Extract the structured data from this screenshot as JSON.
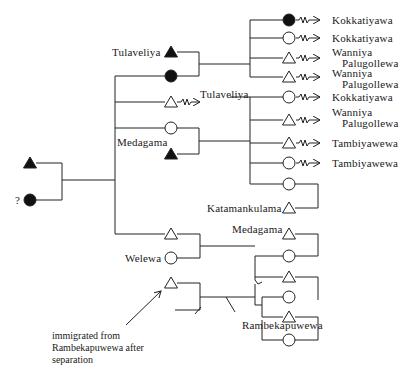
{
  "diagram": {
    "type": "kinship-genealogy",
    "legend_implied": {
      "triangle": "male",
      "circle": "female",
      "filled": "deceased",
      "zigzag-arrow": "moved to village"
    },
    "founders": {
      "male": {
        "symbol": "triangle",
        "filled": true
      },
      "female": {
        "symbol": "circle",
        "filled": true,
        "label": "?"
      }
    },
    "labels": {
      "tulaveliya_top": "Tulaveliya",
      "medagama_mid": "Medagama",
      "tulaveliya_move": "Tulaveliya",
      "welewa": "Welewa",
      "katamankulama": "Katamankulama",
      "medagama_low": "Medagama",
      "rambekapuwewa": "Rambekapuwewa",
      "question": "?"
    },
    "group1_children": [
      {
        "symbol": "circle",
        "filled": true,
        "destination": "Kokkatiyawa"
      },
      {
        "symbol": "circle",
        "filled": false,
        "destination": "Kokkatiyawa"
      },
      {
        "symbol": "triangle",
        "filled": false,
        "destination_line1": "Wanniya",
        "destination_line2": "Palugollewa"
      },
      {
        "symbol": "triangle",
        "filled": false,
        "destination_line1": "Wanniya",
        "destination_line2": "Palugollewa"
      }
    ],
    "group2_children": [
      {
        "symbol": "circle",
        "filled": false,
        "destination": "Kokkatiyawa"
      },
      {
        "symbol": "triangle",
        "filled": false,
        "destination_line1": "Wanniya",
        "destination_line2": "Palugollewa"
      },
      {
        "symbol": "triangle",
        "filled": false,
        "destination": "Tambiyawewa"
      },
      {
        "symbol": "circle",
        "filled": false,
        "destination": "Tambiyawewa"
      },
      {
        "symbol": "circle",
        "filled": false,
        "spouse": "Katamankulama"
      }
    ],
    "group3_children": [
      {
        "symbol": "circle",
        "filled": false,
        "spouse": "Medagama"
      },
      {
        "symbol": "triangle",
        "filled": false
      },
      {
        "symbol": "circle",
        "filled": false
      },
      {
        "symbol": "triangle",
        "filled": false
      },
      {
        "symbol": "circle",
        "filled": false
      }
    ],
    "annotation": {
      "line1": "immigrated from",
      "line2": "Rambekapuwewa after",
      "line3": "separation"
    }
  }
}
